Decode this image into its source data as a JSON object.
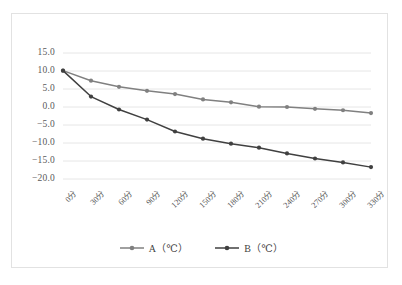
{
  "chart_data": {
    "type": "line",
    "title": "",
    "xlabel": "",
    "ylabel": "",
    "categories": [
      "0分",
      "30分",
      "60分",
      "90分",
      "120分",
      "150分",
      "180分",
      "210分",
      "240分",
      "270分",
      "300分",
      "330分"
    ],
    "series": [
      {
        "name": "A（℃）",
        "color": "#808080",
        "values": [
          10.1,
          7.3,
          5.6,
          4.5,
          3.6,
          2.1,
          1.3,
          0.1,
          0.0,
          -0.5,
          -0.9,
          -1.7
        ]
      },
      {
        "name": "B（℃）",
        "color": "#404040",
        "values": [
          10.1,
          2.9,
          -0.7,
          -3.5,
          -6.8,
          -8.8,
          -10.2,
          -11.3,
          -12.9,
          -14.3,
          -15.4,
          -16.7
        ]
      }
    ],
    "ylim": [
      -20.0,
      15.0
    ],
    "ytick_labels": [
      "15.0",
      "10.0",
      "5.0",
      "0.0",
      "−5.0",
      "−10.0",
      "−15.0",
      "−20.0"
    ],
    "ytick_values": [
      15.0,
      10.0,
      5.0,
      0.0,
      -5.0,
      -10.0,
      -15.0,
      -20.0
    ],
    "grid": true,
    "legend_position": "bottom",
    "grid_color": "#e6e6e6",
    "border_color": "#e2e2e2",
    "text_color": "#5a5a5a"
  }
}
